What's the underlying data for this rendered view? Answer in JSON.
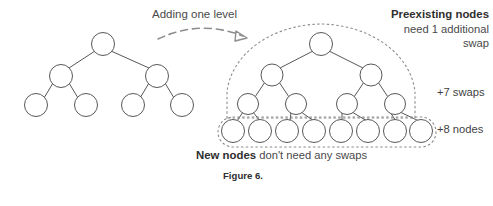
{
  "figure": {
    "caption": "Figure 6.",
    "annotations": {
      "transition_label": "Adding one level",
      "preexisting_title": "Preexisting nodes",
      "preexisting_line2": "need 1 additional",
      "preexisting_line3": "swap",
      "swaps_badge": "+7 swaps",
      "nodes_badge": "+8 nodes",
      "new_nodes_title": "New nodes",
      "new_nodes_rest": " don't need any swaps"
    },
    "colors": {
      "node_stroke": "#58585a",
      "edge_stroke": "#58585a",
      "dotted_stroke": "#8a8a8a",
      "dashed_arrow": "#8d8d8d",
      "text": "#3f3f3f",
      "text_bold": "#2f2f2f",
      "background": "#ffffff"
    },
    "left_tree": {
      "name": "original-tree",
      "levels": 3,
      "node_count": 7,
      "node_radius": 11,
      "nodes": [
        {
          "id": "L-r",
          "level": 0,
          "cx": 103,
          "cy": 44
        },
        {
          "id": "L-a",
          "level": 1,
          "cx": 61,
          "cy": 76
        },
        {
          "id": "L-b",
          "level": 1,
          "cx": 157,
          "cy": 76
        },
        {
          "id": "L-a1",
          "level": 2,
          "cx": 36,
          "cy": 105
        },
        {
          "id": "L-a2",
          "level": 2,
          "cx": 86,
          "cy": 105
        },
        {
          "id": "L-b1",
          "level": 2,
          "cx": 133,
          "cy": 105
        },
        {
          "id": "L-b2",
          "level": 2,
          "cx": 182,
          "cy": 105
        }
      ],
      "edges": [
        [
          "L-r",
          "L-a"
        ],
        [
          "L-r",
          "L-b"
        ],
        [
          "L-a",
          "L-a1"
        ],
        [
          "L-a",
          "L-a2"
        ],
        [
          "L-b",
          "L-b1"
        ],
        [
          "L-b",
          "L-b2"
        ]
      ]
    },
    "right_tree": {
      "name": "expanded-tree",
      "levels": 4,
      "node_count": 15,
      "preexisting_nodes": 7,
      "new_nodes": 8,
      "node_radius_upper": 11,
      "node_radius_leaf": 12,
      "nodes": [
        {
          "id": "R-r",
          "level": 0,
          "cx": 321,
          "cy": 44
        },
        {
          "id": "R-a",
          "level": 1,
          "cx": 272,
          "cy": 75
        },
        {
          "id": "R-b",
          "level": 1,
          "cx": 371,
          "cy": 75
        },
        {
          "id": "R-a1",
          "level": 2,
          "cx": 248,
          "cy": 104
        },
        {
          "id": "R-a2",
          "level": 2,
          "cx": 296,
          "cy": 104
        },
        {
          "id": "R-b1",
          "level": 2,
          "cx": 347,
          "cy": 104
        },
        {
          "id": "R-b2",
          "level": 2,
          "cx": 395,
          "cy": 104
        },
        {
          "id": "R-n1",
          "level": 3,
          "cx": 235,
          "cy": 131
        },
        {
          "id": "R-n2",
          "level": 3,
          "cx": 262,
          "cy": 131
        },
        {
          "id": "R-n3",
          "level": 3,
          "cx": 289,
          "cy": 131
        },
        {
          "id": "R-n4",
          "level": 3,
          "cx": 316,
          "cy": 131
        },
        {
          "id": "R-n5",
          "level": 3,
          "cx": 342,
          "cy": 131
        },
        {
          "id": "R-n6",
          "level": 3,
          "cx": 369,
          "cy": 131
        },
        {
          "id": "R-n7",
          "level": 3,
          "cx": 396,
          "cy": 131
        },
        {
          "id": "R-n8",
          "level": 3,
          "cx": 421,
          "cy": 131
        }
      ],
      "edges": [
        [
          "R-r",
          "R-a"
        ],
        [
          "R-r",
          "R-b"
        ],
        [
          "R-a",
          "R-a1"
        ],
        [
          "R-a",
          "R-a2"
        ],
        [
          "R-b",
          "R-b1"
        ],
        [
          "R-b",
          "R-b2"
        ],
        [
          "R-a1",
          "R-n1"
        ],
        [
          "R-a1",
          "R-n2"
        ],
        [
          "R-a2",
          "R-n3"
        ],
        [
          "R-a2",
          "R-n4"
        ],
        [
          "R-b1",
          "R-n5"
        ],
        [
          "R-b1",
          "R-n6"
        ],
        [
          "R-b2",
          "R-n7"
        ],
        [
          "R-b2",
          "R-n8"
        ]
      ]
    }
  }
}
